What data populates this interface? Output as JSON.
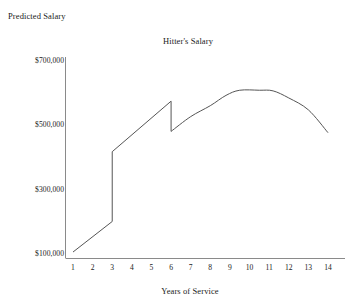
{
  "chart_data": {
    "type": "line",
    "title": "Hitter's Salary",
    "xlabel": "Years of Service",
    "ylabel": "Predicted Salary",
    "grid": false,
    "legend": null,
    "xlim": [
      0.5,
      14.5
    ],
    "ylim": [
      100000,
      700000
    ],
    "xticks": [
      1,
      2,
      3,
      4,
      5,
      6,
      7,
      8,
      9,
      10,
      11,
      12,
      13,
      14
    ],
    "xtick_labels": [
      "1",
      "2",
      "3",
      "4",
      "5",
      "6",
      "7",
      "8",
      "9",
      "10",
      "11",
      "12",
      "13",
      "14"
    ],
    "yticks": [
      100000,
      300000,
      500000,
      700000
    ],
    "ytick_labels": [
      "$100,000",
      "$300,000",
      "$500,000",
      "$700,000"
    ],
    "segments": [
      {
        "name": "pre-arbitration",
        "x": [
          1.0,
          3.0
        ],
        "y": [
          103000,
          198000
        ]
      },
      {
        "name": "arbitration",
        "x": [
          3.0,
          6.0
        ],
        "y": [
          415000,
          572000
        ]
      },
      {
        "name": "free-agency",
        "x": [
          6.0,
          7.0,
          8.0,
          8.8,
          9.5,
          10.5,
          11.2,
          12.0,
          13.0,
          14.0
        ],
        "y": [
          478000,
          524000,
          558000,
          590000,
          606000,
          606000,
          604000,
          582000,
          545000,
          474000
        ]
      }
    ],
    "discontinuities": [
      {
        "at_x": 3.0,
        "from_y": 198000,
        "to_y": 415000,
        "kind": "step-up"
      },
      {
        "at_x": 6.0,
        "from_y": 572000,
        "to_y": 478000,
        "kind": "step-down"
      }
    ],
    "line_color": "#555555"
  },
  "axes": {
    "axis_color": "#8a8a8a"
  }
}
